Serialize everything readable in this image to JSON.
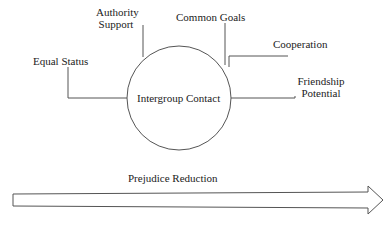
{
  "diagram": {
    "center": {
      "label": "Intergroup Contact"
    },
    "factors": [
      {
        "id": "equal-status",
        "label": "Equal Status"
      },
      {
        "id": "authority-support",
        "label_line1": "Authority",
        "label_line2": "Support"
      },
      {
        "id": "common-goals",
        "label": "Common Goals"
      },
      {
        "id": "cooperation",
        "label": "Cooperation"
      },
      {
        "id": "friendship-potential",
        "label_line1": "Friendship",
        "label_line2": "Potential"
      }
    ],
    "arrow": {
      "label": "Prejudice Reduction"
    },
    "colors": {
      "line": "#555555",
      "text": "#222222",
      "background": "#ffffff"
    }
  }
}
